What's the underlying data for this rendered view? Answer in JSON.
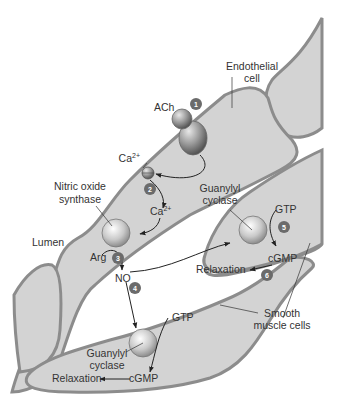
{
  "diagram": {
    "colors": {
      "cell_fill": "#d3d3d3",
      "cell_outline": "#8c8c8c",
      "background": "#ffffff",
      "badge": "#6b6b6b",
      "text": "#333333",
      "arrow": "#222222"
    },
    "labels": {
      "endothelial_line1": "Endothelial",
      "endothelial_line2": "cell",
      "ach": "ACh",
      "ca_top": "Ca",
      "ca_top_sup": "2+",
      "ca_mid": "Ca",
      "ca_mid_sup": "2+",
      "nos_line1": "Nitric oxide",
      "nos_line2": "synthase",
      "lumen": "Lumen",
      "arg": "Arg",
      "no": "NO",
      "gc_upper_line1": "Guanylyl",
      "gc_upper_line2": "cyclase",
      "gtp_upper": "GTP",
      "cgmp_upper": "cGMP",
      "relaxation_upper": "Relaxation",
      "smooth_line1": "Smooth",
      "smooth_line2": "muscle cells",
      "gtp_lower": "GTP",
      "gc_lower_line1": "Guanylyl",
      "gc_lower_line2": "cyclase",
      "relaxation_lower": "Relaxation",
      "cgmp_lower": "cGMP"
    },
    "steps": [
      "1",
      "2",
      "3",
      "4",
      "5",
      "6"
    ]
  }
}
